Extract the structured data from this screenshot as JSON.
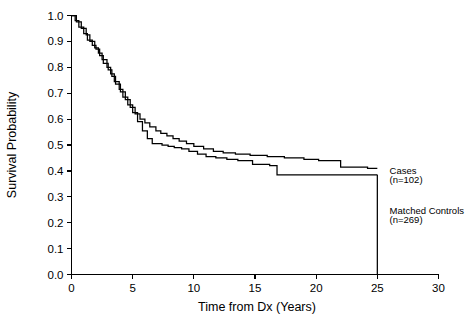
{
  "chart_data": {
    "type": "line",
    "title": "",
    "subtitle": "",
    "xlabel": "Time from Dx  (Years)",
    "ylabel": "Survival Probability",
    "xlim": [
      0,
      30
    ],
    "ylim": [
      0.0,
      1.0
    ],
    "xticks": [
      "0",
      "5",
      "10",
      "15",
      "20",
      "25",
      "30"
    ],
    "xtick_values": [
      0,
      5,
      10,
      15,
      20,
      25,
      30
    ],
    "yticks": [
      "0.0",
      "0.1",
      "0.2",
      "0.3",
      "0.4",
      "0.5",
      "0.6",
      "0.7",
      "0.8",
      "0.9",
      "1.0"
    ],
    "ytick_values": [
      0.0,
      0.1,
      0.2,
      0.3,
      0.4,
      0.5,
      0.6,
      0.7,
      0.8,
      0.9,
      1.0
    ],
    "grid": false,
    "legend_position": "right-inline",
    "line_color": "#000000",
    "background_color": "#ffffff",
    "series": [
      {
        "name": "Matched Controls",
        "label_line1": "Matched Controls",
        "label_line2": "(n=269)",
        "n": 269,
        "step": "post",
        "x": [
          0.0,
          0.3,
          0.6,
          1.0,
          1.3,
          1.7,
          2.0,
          2.3,
          2.6,
          3.0,
          3.3,
          3.6,
          4.0,
          4.4,
          4.8,
          5.2,
          5.6,
          6.0,
          6.4,
          6.9,
          7.3,
          7.8,
          8.3,
          8.8,
          9.4,
          10.0,
          10.8,
          11.6,
          12.4,
          13.4,
          14.6,
          16.0,
          17.4,
          19.0,
          20.2,
          22.0,
          24.2,
          25.0
        ],
        "y": [
          1.0,
          0.98,
          0.955,
          0.93,
          0.905,
          0.885,
          0.87,
          0.845,
          0.815,
          0.79,
          0.765,
          0.735,
          0.705,
          0.675,
          0.645,
          0.62,
          0.6,
          0.585,
          0.57,
          0.555,
          0.545,
          0.535,
          0.525,
          0.515,
          0.505,
          0.495,
          0.485,
          0.475,
          0.47,
          0.465,
          0.46,
          0.455,
          0.45,
          0.445,
          0.44,
          0.415,
          0.41,
          0.41
        ]
      },
      {
        "name": "Cases",
        "label_line1": "Cases",
        "label_line2": "(n=102)",
        "n": 102,
        "step": "post",
        "x": [
          0.0,
          0.4,
          0.8,
          1.2,
          1.5,
          1.9,
          2.2,
          2.5,
          2.9,
          3.2,
          3.5,
          3.9,
          4.2,
          4.6,
          5.0,
          5.4,
          5.8,
          6.2,
          6.6,
          7.0,
          7.4,
          7.9,
          8.4,
          9.0,
          9.6,
          10.3,
          11.0,
          11.8,
          12.7,
          13.6,
          14.8,
          16.2,
          16.8,
          18.5,
          21.0,
          25.0
        ],
        "y": [
          1.0,
          0.975,
          0.95,
          0.925,
          0.9,
          0.875,
          0.855,
          0.83,
          0.8,
          0.775,
          0.745,
          0.715,
          0.685,
          0.655,
          0.625,
          0.59,
          0.555,
          0.525,
          0.505,
          0.505,
          0.5,
          0.495,
          0.49,
          0.485,
          0.475,
          0.465,
          0.455,
          0.45,
          0.445,
          0.44,
          0.425,
          0.42,
          0.385,
          0.385,
          0.385,
          0.385
        ]
      }
    ],
    "annotations": [
      {
        "text": "Cases",
        "x": 26.0,
        "y": 0.4
      },
      {
        "text": "(n=102)",
        "x": 26.0,
        "y": 0.365
      },
      {
        "text": "Matched Controls",
        "x": 26.0,
        "y": 0.245
      },
      {
        "text": "(n=269)",
        "x": 26.0,
        "y": 0.21
      }
    ],
    "terminal_drop": {
      "x": 25.0,
      "from_y": 0.385,
      "to_y": 0.0
    }
  }
}
